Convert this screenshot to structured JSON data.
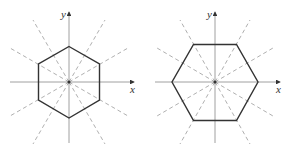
{
  "figures": [
    {
      "name": "hexagon-vertex-up",
      "axis_labels": {
        "x": "x",
        "y": "y"
      },
      "center": [
        69,
        82
      ],
      "hexagon_orientation": "pointy-top",
      "hexagon_radius": 36,
      "symmetry_lines": 6
    },
    {
      "name": "hexagon-flat-top",
      "axis_labels": {
        "x": "x",
        "y": "y"
      },
      "center": [
        215,
        82
      ],
      "hexagon_orientation": "flat-top",
      "hexagon_radius": 43,
      "symmetry_lines": 6
    }
  ],
  "colors": {
    "hexagon": "#333333",
    "axis": "#888888",
    "symmetry_line": "#9a9a9a"
  }
}
